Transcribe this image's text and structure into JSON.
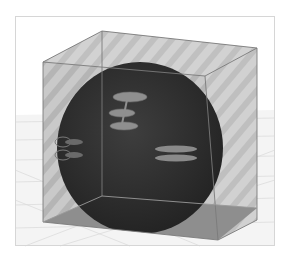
{
  "scene": {
    "description": "3D render of a dark sphere inside a translucent striped cube over a gridded floor",
    "colors": {
      "background": "#ffffff",
      "floor": "#f4f4f4",
      "floor_grid": "#d8d8d8",
      "frame_border": "#d6d6d6",
      "cube_face_light": "#c8c8c8",
      "cube_face_stripe": "#b4b4b4",
      "cube_edge": "#7a7a7a",
      "cube_bottom": "#8c8c8c",
      "sphere": "#2e2e2e",
      "sphere_highlight": "#3c3c3c",
      "features": "#8f8f8f"
    },
    "objects": [
      {
        "name": "cube",
        "type": "translucent-box"
      },
      {
        "name": "sphere",
        "type": "dark-sphere"
      },
      {
        "name": "tree-like-feature",
        "type": "surface-marking"
      },
      {
        "name": "double-bar-feature",
        "type": "surface-marking"
      },
      {
        "name": "ring-feature",
        "type": "surface-marking"
      }
    ]
  }
}
